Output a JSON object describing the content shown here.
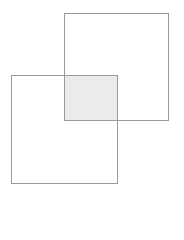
{
  "diagram": {
    "type": "overlapping-squares",
    "shapes": [
      {
        "name": "square-top-right",
        "x": 64,
        "y": 13,
        "width": 105,
        "height": 108
      },
      {
        "name": "square-bottom-left",
        "x": 11,
        "y": 75,
        "width": 107,
        "height": 109
      }
    ],
    "intersection": {
      "x": 64,
      "y": 75,
      "width": 54,
      "height": 46,
      "fill": "#ebebeb"
    },
    "colors": {
      "stroke": "#9a9a9a",
      "intersection_fill": "#ebebeb",
      "background": "#ffffff"
    }
  }
}
